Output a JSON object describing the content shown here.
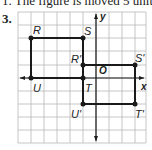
{
  "header": {
    "top_text": "1. The figure is moved 5 unit",
    "problem_number": "3."
  },
  "graph": {
    "x_axis_label": "x",
    "y_axis_label": "y",
    "origin_label": "O",
    "grid_color": "#b8b8b8",
    "line_color": "#1a1a1a",
    "original_figure": {
      "vertices": [
        {
          "name": "R",
          "label": "R"
        },
        {
          "name": "S",
          "label": "S"
        },
        {
          "name": "T",
          "label": "T"
        },
        {
          "name": "U",
          "label": "U"
        }
      ]
    },
    "image_figure": {
      "vertices": [
        {
          "name": "R'",
          "label": "R'"
        },
        {
          "name": "S'",
          "label": "S'"
        },
        {
          "name": "T'",
          "label": "T'"
        },
        {
          "name": "U'",
          "label": "U'"
        }
      ]
    }
  }
}
